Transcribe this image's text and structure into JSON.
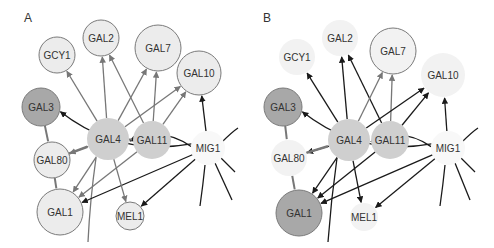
{
  "figure": {
    "colors": {
      "node_light": "#ececec",
      "node_faint": "#f2f2f2",
      "node_mid": "#cfcfcf",
      "node_dark": "#a8a8a8",
      "node_white": "#f8f8f8",
      "stroke_node": "#7a7a7a",
      "edge_gray": "#777777",
      "edge_black": "#1a1a1a"
    },
    "panels": [
      {
        "id": "A",
        "label": "A",
        "label_pos": [
          24,
          22
        ],
        "nodes": [
          {
            "id": "GCY1",
            "label": "GCY1",
            "x": 57,
            "y": 55,
            "r": 18,
            "fill": "#ececec",
            "stroke": true
          },
          {
            "id": "GAL2",
            "label": "GAL2",
            "x": 101,
            "y": 38,
            "r": 18,
            "fill": "#ececec",
            "stroke": true
          },
          {
            "id": "GAL7",
            "label": "GAL7",
            "x": 158,
            "y": 48,
            "r": 23,
            "fill": "#ececec",
            "stroke": true
          },
          {
            "id": "GAL10",
            "label": "GAL10",
            "x": 199,
            "y": 73,
            "r": 22,
            "fill": "#ececec",
            "stroke": true
          },
          {
            "id": "GAL3",
            "label": "GAL3",
            "x": 41,
            "y": 107,
            "r": 19,
            "fill": "#a8a8a8",
            "stroke": true
          },
          {
            "id": "GAL4",
            "label": "GAL4",
            "x": 108,
            "y": 139,
            "r": 21,
            "fill": "#cfcfcf",
            "stroke": false
          },
          {
            "id": "GAL11",
            "label": "GAL11",
            "x": 152,
            "y": 140,
            "r": 19,
            "fill": "#cfcfcf",
            "stroke": false
          },
          {
            "id": "GAL80",
            "label": "GAL80",
            "x": 52,
            "y": 160,
            "r": 18,
            "fill": "#ececec",
            "stroke": true
          },
          {
            "id": "MIG1",
            "label": "MIG1",
            "x": 208,
            "y": 148,
            "r": 17,
            "fill": "#f8f8f8",
            "stroke": false
          },
          {
            "id": "GAL1",
            "label": "GAL1",
            "x": 60,
            "y": 212,
            "r": 23,
            "fill": "#ececec",
            "stroke": true
          },
          {
            "id": "MEL1",
            "label": "MEL1",
            "x": 130,
            "y": 216,
            "r": 14,
            "fill": "#ececec",
            "stroke": true
          }
        ],
        "edges": [
          {
            "from": "GAL4",
            "to": "GCY1",
            "color": "gray",
            "arrow": true
          },
          {
            "from": "GAL4",
            "to": "GAL2",
            "color": "gray",
            "arrow": true
          },
          {
            "from": "GAL11",
            "to": "GAL2",
            "color": "gray",
            "arrow": true
          },
          {
            "from": "GAL4",
            "to": "GAL7",
            "color": "gray",
            "arrow": true
          },
          {
            "from": "GAL11",
            "to": "GAL7",
            "color": "gray",
            "arrow": true
          },
          {
            "from": "GAL4",
            "to": "GAL10",
            "color": "gray",
            "arrow": true
          },
          {
            "from": "GAL11",
            "to": "GAL10",
            "color": "gray",
            "arrow": true
          },
          {
            "from": "MIG1",
            "to": "GAL10",
            "color": "black",
            "arrow": true
          },
          {
            "from": "MIG1",
            "to": "GAL3",
            "color": "black",
            "arrow": true,
            "curve": -30
          },
          {
            "from": "MIG1",
            "to": "GAL4",
            "color": "black",
            "arrow": true,
            "curve": 18
          },
          {
            "from": "MIG1",
            "to": "GAL1",
            "color": "black",
            "arrow": true
          },
          {
            "from": "MIG1",
            "to": "MEL1",
            "color": "black",
            "arrow": true
          },
          {
            "from": "GAL4",
            "to": "GAL80",
            "color": "gray",
            "arrow": true
          },
          {
            "from": "GAL4",
            "to": "GAL1",
            "color": "gray",
            "arrow": true
          },
          {
            "from": "GAL11",
            "to": "GAL1",
            "color": "gray",
            "arrow": true
          },
          {
            "from": "GAL4",
            "to": "MEL1",
            "color": "gray",
            "arrow": true
          },
          {
            "from": "GAL3",
            "to": "GAL80",
            "color": "gray",
            "arrow": false,
            "width": 2
          },
          {
            "from": "GAL80",
            "to": "GAL1",
            "color": "gray",
            "arrow": false,
            "width": 2
          },
          {
            "from": "GAL80",
            "to": "GAL4",
            "color": "gray",
            "arrow": false,
            "width": 2.5
          },
          {
            "from": "GAL4",
            "to": "GAL11",
            "color": "gray",
            "arrow": false,
            "width": 2
          }
        ],
        "stubs": [
          {
            "d": "M 96 158 Q 90 200 88 242",
            "color": "gray"
          },
          {
            "d": "M 222 142 Q 232 132 238 128",
            "color": "black"
          },
          {
            "d": "M 220 157 L 235 172",
            "color": "black"
          },
          {
            "d": "M 215 163 L 232 200",
            "color": "black"
          },
          {
            "d": "M 205 165 Q 203 185 200 206",
            "color": "black"
          }
        ]
      },
      {
        "id": "B",
        "label": "B",
        "label_pos": [
          263,
          22
        ],
        "nodes": [
          {
            "id": "GCY1",
            "label": "GCY1",
            "x": 297,
            "y": 57,
            "r": 18,
            "fill": "#f2f2f2",
            "stroke": false
          },
          {
            "id": "GAL2",
            "label": "GAL2",
            "x": 340,
            "y": 38,
            "r": 18,
            "fill": "#f2f2f2",
            "stroke": false
          },
          {
            "id": "GAL7",
            "label": "GAL7",
            "x": 393,
            "y": 51,
            "r": 23,
            "fill": "#f2f2f2",
            "stroke": true
          },
          {
            "id": "GAL10",
            "label": "GAL10",
            "x": 443,
            "y": 75,
            "r": 22,
            "fill": "#f2f2f2",
            "stroke": false
          },
          {
            "id": "GAL3",
            "label": "GAL3",
            "x": 283,
            "y": 107,
            "r": 19,
            "fill": "#a8a8a8",
            "stroke": true
          },
          {
            "id": "GAL4",
            "label": "GAL4",
            "x": 349,
            "y": 140,
            "r": 21,
            "fill": "#cfcfcf",
            "stroke": false
          },
          {
            "id": "GAL11",
            "label": "GAL11",
            "x": 390,
            "y": 140,
            "r": 19,
            "fill": "#cfcfcf",
            "stroke": false
          },
          {
            "id": "GAL80",
            "label": "GAL80",
            "x": 289,
            "y": 158,
            "r": 18,
            "fill": "#f2f2f2",
            "stroke": false
          },
          {
            "id": "MIG1",
            "label": "MIG1",
            "x": 448,
            "y": 148,
            "r": 17,
            "fill": "#f8f8f8",
            "stroke": false
          },
          {
            "id": "GAL1",
            "label": "GAL1",
            "x": 299,
            "y": 213,
            "r": 23,
            "fill": "#a8a8a8",
            "stroke": true
          },
          {
            "id": "MEL1",
            "label": "MEL1",
            "x": 364,
            "y": 217,
            "r": 14,
            "fill": "#f2f2f2",
            "stroke": false
          }
        ],
        "edges": [
          {
            "from": "GAL4",
            "to": "GCY1",
            "color": "black",
            "arrow": true
          },
          {
            "from": "GAL4",
            "to": "GAL2",
            "color": "black",
            "arrow": true
          },
          {
            "from": "GAL11",
            "to": "GAL2",
            "color": "black",
            "arrow": true
          },
          {
            "from": "GAL4",
            "to": "GAL7",
            "color": "gray",
            "arrow": true
          },
          {
            "from": "GAL11",
            "to": "GAL7",
            "color": "gray",
            "arrow": true
          },
          {
            "from": "GAL4",
            "to": "GAL10",
            "color": "black",
            "arrow": true
          },
          {
            "from": "GAL11",
            "to": "GAL10",
            "color": "black",
            "arrow": true
          },
          {
            "from": "MIG1",
            "to": "GAL10",
            "color": "black",
            "arrow": true
          },
          {
            "from": "MIG1",
            "to": "GAL3",
            "color": "black",
            "arrow": true,
            "curve": -30
          },
          {
            "from": "MIG1",
            "to": "GAL4",
            "color": "black",
            "arrow": true,
            "curve": 18
          },
          {
            "from": "MIG1",
            "to": "GAL1",
            "color": "black",
            "arrow": true
          },
          {
            "from": "MIG1",
            "to": "MEL1",
            "color": "black",
            "arrow": true
          },
          {
            "from": "GAL4",
            "to": "GAL80",
            "color": "black",
            "arrow": true
          },
          {
            "from": "GAL4",
            "to": "GAL1",
            "color": "black",
            "arrow": true
          },
          {
            "from": "GAL11",
            "to": "GAL1",
            "color": "black",
            "arrow": true
          },
          {
            "from": "GAL4",
            "to": "MEL1",
            "color": "black",
            "arrow": true
          },
          {
            "from": "GAL3",
            "to": "GAL80",
            "color": "gray",
            "arrow": false,
            "width": 2
          },
          {
            "from": "GAL80",
            "to": "GAL1",
            "color": "gray",
            "arrow": false,
            "width": 2
          },
          {
            "from": "GAL80",
            "to": "GAL4",
            "color": "gray",
            "arrow": false,
            "width": 2.5
          },
          {
            "from": "GAL4",
            "to": "GAL11",
            "color": "gray",
            "arrow": false,
            "width": 2
          }
        ],
        "stubs": [
          {
            "d": "M 337 158 Q 331 200 328 242",
            "color": "black"
          },
          {
            "d": "M 462 142 Q 472 132 478 128",
            "color": "black"
          },
          {
            "d": "M 460 157 L 475 172",
            "color": "black"
          },
          {
            "d": "M 455 163 L 470 200",
            "color": "black"
          },
          {
            "d": "M 445 165 Q 443 185 440 206",
            "color": "black"
          }
        ]
      }
    ]
  }
}
